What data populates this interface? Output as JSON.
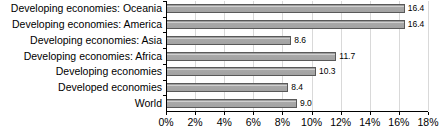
{
  "chart_data": {
    "type": "bar",
    "orientation": "horizontal",
    "title": "",
    "xlabel": "",
    "ylabel": "",
    "xlim": [
      0,
      18
    ],
    "xtick_labels": [
      "0%",
      "2%",
      "4%",
      "6%",
      "8%",
      "10%",
      "12%",
      "14%",
      "16%",
      "18%"
    ],
    "xtick_values": [
      0,
      2,
      4,
      6,
      8,
      10,
      12,
      14,
      16,
      18
    ],
    "grid": true,
    "legend": false,
    "value_label_format": "one-decimal",
    "categories": [
      "Developing economies: Oceania",
      "Developing economies: America",
      "Developing economies: Asia",
      "Developing economies: Africa",
      "Developing economies",
      "Developed economies",
      "World"
    ],
    "values": [
      16.4,
      16.4,
      8.6,
      11.7,
      10.3,
      8.4,
      9.0
    ],
    "value_labels": [
      "16.4",
      "16.4",
      "8.6",
      "11.7",
      "10.3",
      "8.4",
      "9.0"
    ],
    "colors": {
      "bar_fill": "#a3a3a3",
      "bar_highlight": "#cfcfcf",
      "bar_border": "#595959",
      "gridline": "#d9d9d9",
      "axis": "#000000",
      "text": "#000000",
      "background": "#ffffff"
    }
  }
}
